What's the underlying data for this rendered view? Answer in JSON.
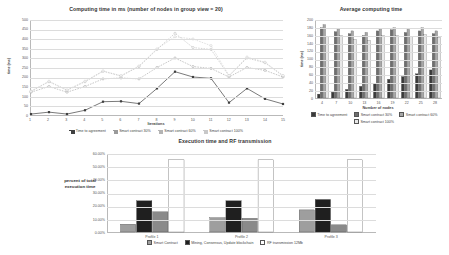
{
  "chart_data": [
    {
      "type": "line",
      "title": "Computing time in ms (number of nodes in group view  = 20)",
      "xlabel": "Iterations",
      "ylabel": "time (ms)",
      "categories": [
        "1",
        "2",
        "3",
        "4",
        "5",
        "6",
        "7",
        "8",
        "9",
        "10",
        "11",
        "12",
        "13",
        "14",
        "15"
      ],
      "ylim": [
        0,
        500
      ],
      "yticks": [
        "0",
        "50",
        "100",
        "150",
        "200",
        "250",
        "300",
        "350",
        "400",
        "450",
        "500"
      ],
      "grid": true,
      "legend_position": "bottom",
      "series": [
        {
          "name": "Time to agreement",
          "color": "#404040",
          "values": [
            5,
            15,
            5,
            25,
            70,
            72,
            60,
            140,
            228,
            200,
            193,
            65,
            140,
            85,
            58
          ]
        },
        {
          "name": "Smart contract 30%",
          "color": "#9a9a9a",
          "values": [
            120,
            150,
            120,
            150,
            190,
            195,
            190,
            250,
            300,
            255,
            245,
            200,
            250,
            235,
            200
          ]
        },
        {
          "name": "Smart contract 60%",
          "color": "#b4b4b4",
          "values": [
            125,
            175,
            130,
            175,
            230,
            205,
            255,
            345,
            430,
            355,
            345,
            205,
            300,
            275,
            205
          ]
        },
        {
          "name": "Smart contract 100%",
          "color": "#c8c8c8",
          "values": [
            125,
            178,
            132,
            178,
            232,
            207,
            258,
            348,
            412,
            400,
            365,
            208,
            305,
            278,
            208
          ]
        }
      ]
    },
    {
      "type": "bar",
      "title": "Average computing time",
      "xlabel": "Number of nodes",
      "ylabel": "time (ms)",
      "categories": [
        "4",
        "7",
        "10",
        "13",
        "16",
        "19",
        "22",
        "25",
        "28"
      ],
      "ylim": [
        0,
        200
      ],
      "yticks": [
        "0",
        "20",
        "40",
        "60",
        "80",
        "100",
        "120",
        "140",
        "160",
        "180",
        "200"
      ],
      "grid": true,
      "legend_position": "bottom",
      "series": [
        {
          "name": "Time to agreement",
          "color": "#3a3a3a",
          "values": [
            10,
            15,
            22,
            30,
            38,
            48,
            55,
            62,
            72
          ]
        },
        {
          "name": "Smart contract 30%",
          "color": "#6e6e6e",
          "values": [
            180,
            170,
            165,
            160,
            172,
            175,
            168,
            172,
            165
          ]
        },
        {
          "name": "Smart contract 60%",
          "color": "#a8a8a8",
          "values": [
            188,
            178,
            172,
            168,
            178,
            180,
            176,
            180,
            172
          ]
        },
        {
          "name": "Smart contract 100%",
          "color": "#e8e8e8",
          "values": [
            158,
            160,
            150,
            148,
            160,
            160,
            158,
            162,
            155
          ]
        }
      ]
    },
    {
      "type": "bar",
      "title": "Execution time and RF transmission",
      "xlabel": "",
      "ylabel": "percent of total execution time",
      "categories": [
        "Profile 1",
        "Profile 2",
        "Profile 3"
      ],
      "ylim": [
        0,
        60
      ],
      "yticks": [
        "0.00%",
        "10.00%",
        "20.00%",
        "30.00%",
        "40.00%",
        "50.00%",
        "60.00%"
      ],
      "grid": true,
      "legend_position": "bottom",
      "series": [
        {
          "name": "Smart Contract",
          "color": "#9e9e9e",
          "values": [
            6.0,
            11.0,
            17.0
          ]
        },
        {
          "name": "Mining, Consensus, Update blockchain",
          "color": "#1f1f1f",
          "values": [
            24.0,
            24.0,
            25.0
          ]
        },
        {
          "name": "RF transmission 12Mb",
          "color": "#ffffff",
          "values": [
            55.5,
            55.5,
            55.5
          ]
        }
      ],
      "extra_series": [
        {
          "name": "secondary",
          "color": "#8a8a8a",
          "values": [
            15.5,
            10.5,
            5.5
          ]
        }
      ]
    }
  ],
  "charts": {
    "line": {
      "title": "Computing time in ms (number of nodes in group view  = 20)",
      "xlabel": "Iterations",
      "ylabel": "time (ms)",
      "legend": [
        "Time to agreement",
        "Smart contract 30%",
        "Smart contract 60%",
        "Smart contract 100%"
      ]
    },
    "avg": {
      "title": "Average computing time",
      "xlabel": "Number of nodes",
      "ylabel": "time (ms)",
      "legend": [
        "Time to agreement",
        "Smart contract 30%",
        "Smart contract 60%",
        "Smart contract 100%"
      ]
    },
    "exec": {
      "title": "Execution time and RF transmission",
      "ylabel_line1": "percent of total",
      "ylabel_line2": "execution time",
      "legend": [
        "Smart Contract",
        "Mining, Consensus, Update blockchain",
        "RF transmission 12Mb"
      ]
    }
  }
}
